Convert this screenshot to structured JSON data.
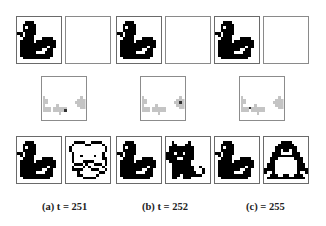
{
  "figure": {
    "columns": [
      {
        "id": "a",
        "caption": "(a) t = 251",
        "top_row": [
          "swan",
          "blank"
        ],
        "middle": "gray-arrow-reconstruction",
        "bottom_row": [
          "swan",
          "dog-outline"
        ]
      },
      {
        "id": "b",
        "caption": "(b) t = 252",
        "top_row": [
          "swan",
          "blank"
        ],
        "middle": "gray-arrow-reconstruction",
        "bottom_row": [
          "swan",
          "cat"
        ]
      },
      {
        "id": "c",
        "caption": "(c) = 255",
        "top_row": [
          "swan",
          "blank"
        ],
        "middle": "gray-arrow-reconstruction",
        "bottom_row": [
          "swan",
          "penguin"
        ]
      }
    ],
    "colors": {
      "pixel_black": "#000000",
      "pixel_gray": "#bdbdbd",
      "border": "#6a6a6a",
      "background": "#ffffff"
    }
  }
}
